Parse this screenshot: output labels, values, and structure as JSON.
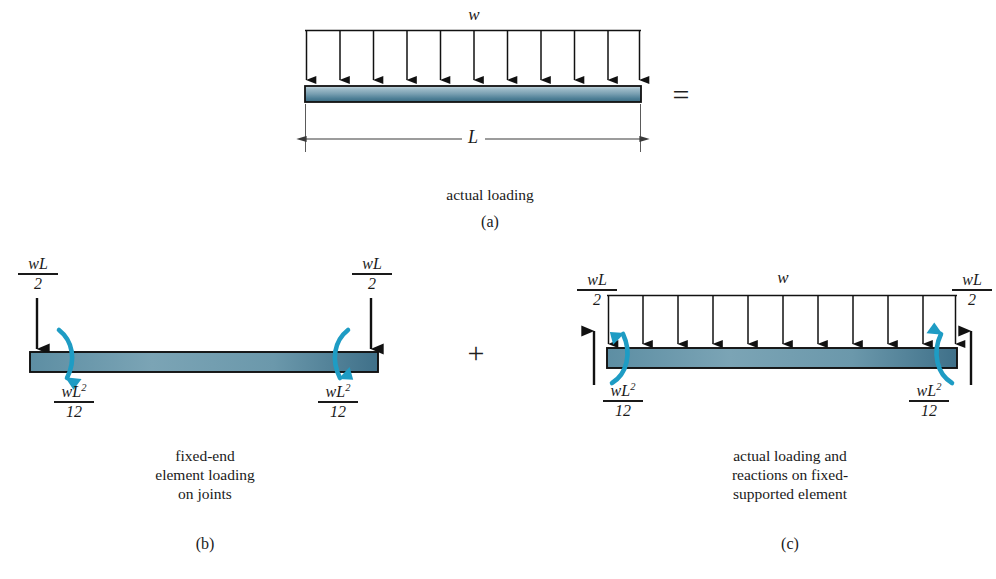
{
  "figure": {
    "title_symbols": {
      "equals": "=",
      "plus": "+"
    },
    "load_symbol": "w",
    "span_symbol": "L"
  },
  "panels": [
    {
      "id": "a",
      "letter": "(a)",
      "caption": "actual loading",
      "load_label": "w",
      "span_label": "L",
      "num_load_arrows": 11,
      "beam": {
        "x": 305,
        "y": 86,
        "width": 336,
        "height": 16
      },
      "load_line_y": 30,
      "dimension_y": 139
    },
    {
      "id": "b",
      "letter": "(b)",
      "caption": "fixed-end\nelement loading\non joints",
      "end_force_label": {
        "num": "wL",
        "den": "2"
      },
      "end_moment_label": {
        "num": "wL",
        "sup": "2",
        "den": "12"
      },
      "beam": {
        "x": 30,
        "y": 352,
        "width": 348,
        "height": 20
      },
      "left_force_x": 37,
      "right_force_x": 371,
      "force_arrow_top": 298,
      "force_arrow_bottom": 352
    },
    {
      "id": "c",
      "letter": "(c)",
      "caption": "actual loading and\nreactions on fixed-\nsupported element",
      "load_label": "w",
      "end_force_label": {
        "num": "wL",
        "den": "2"
      },
      "end_moment_label": {
        "num": "wL",
        "sup": "2",
        "den": "12"
      },
      "num_load_arrows": 11,
      "beam": {
        "x": 607,
        "y": 348,
        "width": 350,
        "height": 20
      },
      "load_line_y": 295,
      "left_reaction_x": 594,
      "right_reaction_x": 971,
      "reaction_arrow_bottom": 385,
      "reaction_arrow_top": 330
    }
  ],
  "colors": {
    "beam_dark": "#2f5f73",
    "beam_mid": "#6d95a8",
    "beam_light": "#b9ccd6",
    "moment_arrow": "#1e9cc4",
    "outline": "#111111",
    "text": "#1a1a1a",
    "dimension_line": "#3a3a3a"
  },
  "labels": {
    "panel_a_caption": "actual loading",
    "panel_a_letter": "(a)",
    "panel_b_caption_line1": "fixed-end",
    "panel_b_caption_line2": "element loading",
    "panel_b_caption_line3": "on joints",
    "panel_b_letter": "(b)",
    "panel_c_caption_line1": "actual loading and",
    "panel_c_caption_line2": "reactions on fixed-",
    "panel_c_caption_line3": "supported element",
    "panel_c_letter": "(c)",
    "equals_sign": "=",
    "plus_sign": "+",
    "w_a": "w",
    "w_c": "w",
    "L_a": "L",
    "frac_wL_num": "wL",
    "frac_wL_den": "2",
    "frac_wL2_num": "wL",
    "frac_wL2_sup": "2",
    "frac_wL2_den": "12"
  }
}
